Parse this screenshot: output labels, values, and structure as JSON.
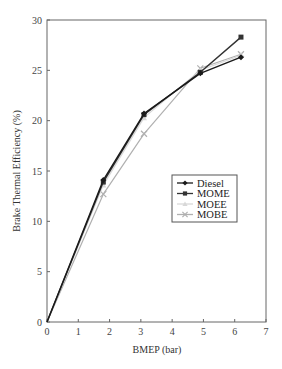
{
  "chart_data": {
    "type": "line",
    "title": "",
    "xlabel": "BMEP (bar)",
    "ylabel": "Brake Thermal Efficiency (%)",
    "xlim": [
      0,
      7
    ],
    "ylim": [
      0,
      30
    ],
    "xticks": [
      0,
      1,
      2,
      3,
      4,
      5,
      6,
      7
    ],
    "yticks": [
      0,
      5,
      10,
      15,
      20,
      25,
      30
    ],
    "grid": false,
    "legend_position": "center-right",
    "series": [
      {
        "name": "Diesel",
        "marker": "diamond",
        "color": "#1a1a1a",
        "x": [
          0,
          1.8,
          3.1,
          4.9,
          6.2
        ],
        "y": [
          0,
          14.1,
          20.7,
          24.7,
          26.3
        ]
      },
      {
        "name": "MOME",
        "marker": "square",
        "color": "#333333",
        "x": [
          0,
          1.8,
          3.1,
          4.9,
          6.2
        ],
        "y": [
          0,
          13.9,
          20.6,
          24.8,
          28.3
        ]
      },
      {
        "name": "MOEE",
        "marker": "triangle",
        "color": "#d8d8d8",
        "x": [
          0,
          1.8,
          3.1,
          4.9,
          6.2
        ],
        "y": [
          0,
          13.6,
          20.3,
          25.0,
          26.5
        ]
      },
      {
        "name": "MOBE",
        "marker": "x",
        "color": "#b0b0b0",
        "x": [
          0,
          1.8,
          3.1,
          4.9,
          6.2
        ],
        "y": [
          0,
          12.7,
          18.7,
          25.2,
          26.6
        ]
      }
    ]
  }
}
